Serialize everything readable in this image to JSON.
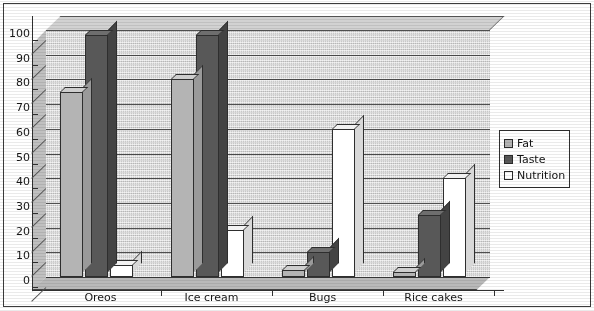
{
  "chart_data": {
    "type": "bar",
    "title": "",
    "subtitle": "",
    "xlabel": "",
    "ylabel": "",
    "ylim": [
      0,
      100
    ],
    "ytick_step": 10,
    "yticks": [
      "100",
      "90",
      "80",
      "70",
      "60",
      "50",
      "40",
      "30",
      "20",
      "10",
      "0"
    ],
    "grid": true,
    "three_d": true,
    "legend_position": "right",
    "categories": [
      "Oreos",
      "Ice cream",
      "Bugs",
      "Rice cakes"
    ],
    "series": [
      {
        "name": "Fat",
        "color": "#b4b4b4",
        "values": [
          75,
          80,
          3,
          2
        ]
      },
      {
        "name": "Taste",
        "color": "#585858",
        "values": [
          98,
          98,
          10,
          25
        ]
      },
      {
        "name": "Nutrition",
        "color": "#ffffff",
        "values": [
          5,
          19,
          60,
          40
        ]
      }
    ]
  },
  "legend": {
    "items": [
      {
        "label": "Fat",
        "swatch": "#b4b4b4"
      },
      {
        "label": "Taste",
        "swatch": "#585858"
      },
      {
        "label": "Nutrition",
        "swatch": "#ffffff"
      }
    ]
  },
  "colors": {
    "plot_background": "#c8c8c8",
    "axis": "#2f2f2f",
    "gridline": "#4f4f4f",
    "frame": "#3b3b3b",
    "page_background": "#ffffff"
  }
}
